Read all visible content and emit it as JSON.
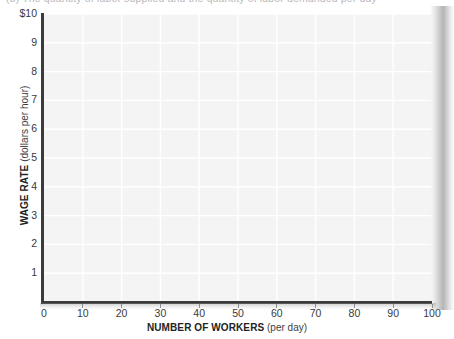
{
  "caption": {
    "text": "(b) The quantity of labor supplied and the quantity of labor demanded per day"
  },
  "chart_data": {
    "type": "scatter",
    "title": "",
    "subtitle": "",
    "xlabel_strong": "NUMBER OF WORKERS",
    "xlabel_light": "(per day)",
    "ylabel_strong": "WAGE RATE",
    "ylabel_light": "(dollars per hour)",
    "xlim": [
      0,
      100
    ],
    "ylim": [
      0,
      10
    ],
    "x_ticks": [
      "0",
      "10",
      "20",
      "30",
      "40",
      "50",
      "60",
      "70",
      "80",
      "90",
      "100"
    ],
    "x_tick_values": [
      0,
      10,
      20,
      30,
      40,
      50,
      60,
      70,
      80,
      90,
      100
    ],
    "y_ticks": [
      "$10",
      "9",
      "8",
      "7",
      "6",
      "5",
      "4",
      "3",
      "2",
      "1"
    ],
    "y_tick_values": [
      10,
      9,
      8,
      7,
      6,
      5,
      4,
      3,
      2,
      1
    ],
    "origin_label": "0",
    "grid": true,
    "grid_x_step": 10,
    "grid_y_step": 1,
    "legend": null,
    "legend_position": "none",
    "series": [],
    "values": [],
    "annotations": [],
    "note": "Empty worksheet grid; no data plotted"
  },
  "style": {
    "axis_color": "#3b3b3b",
    "panel_color": "#f4f4f4",
    "gridline_color": "#ffffff",
    "tick_label_color": "#3a3a3a",
    "page_color": "#ffffff"
  }
}
